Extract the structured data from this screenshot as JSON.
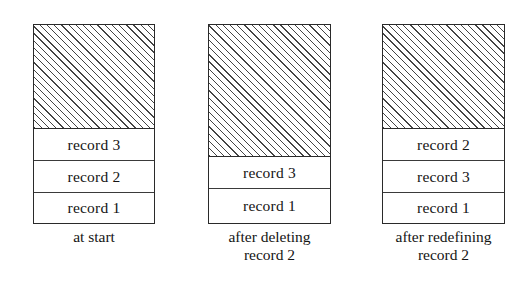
{
  "figure": {
    "type": "diagram",
    "background_color": "#ffffff",
    "ink_color": "#141414",
    "hatch_color": "#444444",
    "panels": [
      {
        "id": "at-start",
        "caption_lines": [
          "at start"
        ],
        "free_space_label": "free space (hatched)",
        "records": [
          "record 3",
          "record 2",
          "record 1"
        ]
      },
      {
        "id": "after-deleting-record-2",
        "caption_lines": [
          "after deleting",
          "record 2"
        ],
        "free_space_label": "free space (hatched)",
        "records": [
          "record 3",
          "record 1"
        ]
      },
      {
        "id": "after-redefining-record-2",
        "caption_lines": [
          "after redefining",
          "record 2"
        ],
        "free_space_label": "free space (hatched)",
        "records": [
          "record 2",
          "record 3",
          "record 1"
        ]
      }
    ]
  }
}
